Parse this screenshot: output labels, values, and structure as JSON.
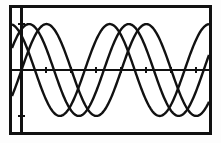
{
  "screen": {
    "device": "graphing-calculator-screen",
    "border_color": "#111111",
    "background_color": "#ffffff",
    "plot_color": "#111111",
    "width_px": 221,
    "height_px": 143
  },
  "chart_data": {
    "type": "line",
    "title": "",
    "subtitle": "",
    "xlabel": "",
    "ylabel": "",
    "grid": false,
    "legend_position": "none",
    "axes": {
      "x_axis_visible": true,
      "y_axis_visible": true,
      "x_axis_y_value": 0,
      "y_axis_x_value": 0,
      "xlim": [
        -0.6,
        11.8
      ],
      "ylim": [
        -1.35,
        1.35
      ],
      "x_tick_interval": 1.5708,
      "y_tick_interval": 1,
      "x_ticks": [
        0,
        1.5708,
        3.1416,
        4.7124,
        6.2832,
        7.854,
        9.4248,
        10.9956
      ],
      "y_ticks": [
        -1,
        1
      ]
    },
    "series": [
      {
        "name": "Y1",
        "expression": "sin(x)",
        "amplitude": 1.0,
        "period": 6.2832,
        "phase": 0.0,
        "vertical_shift": 0.0,
        "points": [
          {
            "x": -0.6,
            "y": -0.565
          },
          {
            "x": 0.0,
            "y": 0.0
          },
          {
            "x": 1.5708,
            "y": 1.0
          },
          {
            "x": 3.1416,
            "y": 0.0
          },
          {
            "x": 4.7124,
            "y": -1.0
          },
          {
            "x": 6.2832,
            "y": 0.0
          },
          {
            "x": 7.854,
            "y": 1.0
          },
          {
            "x": 9.4248,
            "y": -1.0
          },
          {
            "x": 10.9956,
            "y": 0.0
          },
          {
            "x": 11.8,
            "y": 0.72
          }
        ]
      },
      {
        "name": "Y2",
        "expression": "sin(x + 1.1)",
        "amplitude": 1.0,
        "period": 6.2832,
        "phase": 1.1,
        "vertical_shift": 0.0,
        "points": [
          {
            "x": -0.6,
            "y": 0.47
          },
          {
            "x": 0.0,
            "y": 0.891
          },
          {
            "x": 0.47,
            "y": 1.0
          },
          {
            "x": 2.04,
            "y": 0.0
          },
          {
            "x": 3.61,
            "y": -1.0
          },
          {
            "x": 5.18,
            "y": 0.0
          },
          {
            "x": 6.75,
            "y": 1.0
          },
          {
            "x": 8.33,
            "y": 0.0
          },
          {
            "x": 9.9,
            "y": -1.0
          },
          {
            "x": 11.47,
            "y": 0.0
          }
        ]
      },
      {
        "name": "Y3",
        "expression": "sin(x + 2.3)",
        "amplitude": 1.0,
        "period": 6.2832,
        "phase": 2.3,
        "vertical_shift": 0.0,
        "points": [
          {
            "x": -0.6,
            "y": 0.99
          },
          {
            "x": 0.0,
            "y": 0.745
          },
          {
            "x": 0.84,
            "y": 0.0
          },
          {
            "x": 2.41,
            "y": -1.0
          },
          {
            "x": 3.98,
            "y": 0.0
          },
          {
            "x": 5.55,
            "y": 1.0
          },
          {
            "x": 7.13,
            "y": 0.0
          },
          {
            "x": 8.7,
            "y": -1.0
          },
          {
            "x": 10.27,
            "y": 0.0
          },
          {
            "x": 11.8,
            "y": 0.93
          }
        ]
      }
    ]
  }
}
